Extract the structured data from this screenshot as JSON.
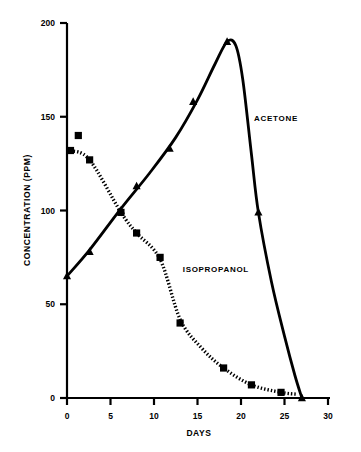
{
  "chart_data": {
    "type": "line",
    "title": "",
    "xlabel": "DAYS",
    "ylabel": "CONCENTRATION (PPM)",
    "xlim": [
      0,
      30
    ],
    "ylim": [
      0,
      200
    ],
    "xticks": [
      "0",
      "5",
      "10",
      "15",
      "20",
      "25",
      "30"
    ],
    "xtick_values": [
      0,
      5,
      10,
      15,
      20,
      25,
      30
    ],
    "yticks": [
      "0",
      "50",
      "100",
      "150",
      "200"
    ],
    "ytick_values": [
      0,
      50,
      100,
      150,
      200
    ],
    "grid": false,
    "legend_position": "inline-annotation",
    "series": [
      {
        "name": "ACETONE",
        "label": "ACETONE",
        "marker": "triangle",
        "linestyle": "solid",
        "color": "#000000",
        "annotation_x": 21.5,
        "annotation_y": 148,
        "points": [
          {
            "x": 0.0,
            "y": 65
          },
          {
            "x": 2.6,
            "y": 78
          },
          {
            "x": 6.2,
            "y": 100
          },
          {
            "x": 8.0,
            "y": 113
          },
          {
            "x": 11.8,
            "y": 133
          },
          {
            "x": 14.5,
            "y": 158
          },
          {
            "x": 18.4,
            "y": 190
          },
          {
            "x": 22.0,
            "y": 99
          },
          {
            "x": 27.0,
            "y": 0
          }
        ],
        "curve": [
          {
            "x": 0.0,
            "y": 65
          },
          {
            "x": 2.6,
            "y": 79
          },
          {
            "x": 6.2,
            "y": 101
          },
          {
            "x": 9.5,
            "y": 120
          },
          {
            "x": 12.5,
            "y": 139
          },
          {
            "x": 15.0,
            "y": 159
          },
          {
            "x": 17.0,
            "y": 178
          },
          {
            "x": 18.4,
            "y": 190
          },
          {
            "x": 19.4,
            "y": 188
          },
          {
            "x": 20.2,
            "y": 170
          },
          {
            "x": 21.2,
            "y": 130
          },
          {
            "x": 22.0,
            "y": 99
          },
          {
            "x": 23.5,
            "y": 62
          },
          {
            "x": 25.0,
            "y": 33
          },
          {
            "x": 26.2,
            "y": 12
          },
          {
            "x": 27.0,
            "y": 0
          }
        ]
      },
      {
        "name": "ISOPROPANOL",
        "label": "ISOPROPANOL",
        "marker": "square",
        "linestyle": "dotted",
        "color": "#000000",
        "annotation_x": 13.3,
        "annotation_y": 67,
        "points": [
          {
            "x": 0.4,
            "y": 132
          },
          {
            "x": 1.3,
            "y": 140
          },
          {
            "x": 2.6,
            "y": 127
          },
          {
            "x": 6.2,
            "y": 99
          },
          {
            "x": 8.0,
            "y": 88
          },
          {
            "x": 10.7,
            "y": 75
          },
          {
            "x": 13.0,
            "y": 40
          },
          {
            "x": 18.0,
            "y": 16
          },
          {
            "x": 21.2,
            "y": 7
          },
          {
            "x": 24.6,
            "y": 3
          }
        ],
        "curve": [
          {
            "x": 0.4,
            "y": 132
          },
          {
            "x": 2.6,
            "y": 127
          },
          {
            "x": 6.2,
            "y": 99
          },
          {
            "x": 8.0,
            "y": 88
          },
          {
            "x": 10.7,
            "y": 74
          },
          {
            "x": 13.0,
            "y": 42
          },
          {
            "x": 15.4,
            "y": 27
          },
          {
            "x": 18.0,
            "y": 16
          },
          {
            "x": 21.2,
            "y": 7
          },
          {
            "x": 24.6,
            "y": 3
          },
          {
            "x": 26.5,
            "y": 2
          }
        ]
      }
    ]
  }
}
